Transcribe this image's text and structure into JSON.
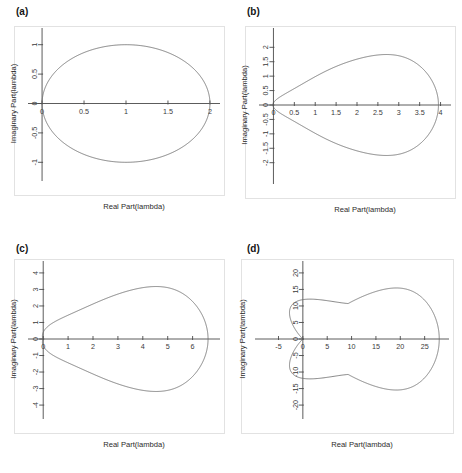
{
  "figure": {
    "background_color": "#ffffff",
    "curve_color": "#6b6b6b",
    "axis_color": "#4a4a4a",
    "frame_color": "#e2e2e2",
    "text_color": "#3a3a3a",
    "panel_count": 4
  },
  "panels": [
    {
      "label": "(a)",
      "xlabel": "Real Part(lambda)",
      "ylabel": "Imaginary Part(lambda)",
      "xticks": [
        "0",
        "0.5",
        "1",
        "1.5",
        "2"
      ],
      "xtick_values": [
        0,
        0.5,
        1,
        1.5,
        2
      ],
      "yticks": [
        "1",
        "0.5",
        "0",
        "-0.5",
        "-1"
      ],
      "ytick_values": [
        1,
        0.5,
        0,
        -0.5,
        -1
      ],
      "xlim": [
        -0.12,
        2.12
      ],
      "ylim": [
        -1.25,
        1.25
      ]
    },
    {
      "label": "(b)",
      "xlabel": "Real Part(lambda)",
      "ylabel": "Imaginary Part(lambda)",
      "xticks": [
        "0",
        "0.5",
        "1",
        "1.5",
        "2",
        "2.5",
        "3",
        "3.5",
        "4"
      ],
      "xtick_values": [
        0,
        0.5,
        1,
        1.5,
        2,
        2.5,
        3,
        3.5,
        4
      ],
      "yticks": [
        "2",
        "1.5",
        "1",
        "0.5",
        "0",
        "-0.5",
        "-1",
        "-1.5",
        "-2"
      ],
      "ytick_values": [
        2,
        1.5,
        1,
        0.5,
        0,
        -0.5,
        -1,
        -1.5,
        -2
      ],
      "xlim": [
        -0.25,
        4.25
      ],
      "ylim": [
        -2.6,
        2.6
      ]
    },
    {
      "label": "(c)",
      "xlabel": "Real Part(lambda)",
      "ylabel": "Imaginary Part(lambda)",
      "xticks": [
        "0",
        "1",
        "2",
        "3",
        "4",
        "5",
        "6"
      ],
      "xtick_values": [
        0,
        1,
        2,
        3,
        4,
        5,
        6
      ],
      "yticks": [
        "4",
        "3",
        "2",
        "1",
        "0",
        "-1",
        "-2",
        "-3",
        "-4"
      ],
      "ytick_values": [
        4,
        3,
        2,
        1,
        0,
        -1,
        -2,
        -3,
        -4
      ],
      "xlim": [
        -0.45,
        7.1
      ],
      "ylim": [
        -4.6,
        4.6
      ]
    },
    {
      "label": "(d)",
      "xlabel": "Real Part(lambda)",
      "ylabel": "Imaginary Part(lambda)",
      "xticks": [
        "-5",
        "0",
        "5",
        "10",
        "15",
        "20",
        "25"
      ],
      "xtick_values": [
        -5,
        0,
        5,
        10,
        15,
        20,
        25
      ],
      "yticks": [
        "20",
        "15",
        "10",
        "5",
        "0",
        "-5",
        "-10",
        "-15",
        "-20"
      ],
      "ytick_values": [
        20,
        15,
        10,
        5,
        0,
        -5,
        -10,
        -15,
        -20
      ],
      "xlim": [
        -9,
        30
      ],
      "ylim": [
        -23,
        23
      ]
    }
  ],
  "chart_data": [
    {
      "type": "line",
      "panel": "(a)",
      "title": "",
      "xlabel": "Real Part(lambda)",
      "ylabel": "Imaginary Part(lambda)",
      "xlim": [
        -0.12,
        2.12
      ],
      "ylim": [
        -1.25,
        1.25
      ],
      "grid": false,
      "legend": "none",
      "description": "Stability region boundary: circle of radius 1 centred at (1,0); locus of 1 - exp(-i*theta).",
      "series": [
        {
          "name": "boundary",
          "closed": true,
          "x": [
            0.0,
            0.0038,
            0.0152,
            0.0341,
            0.0603,
            0.0937,
            0.134,
            0.1808,
            0.2339,
            0.2929,
            0.3572,
            0.4264,
            0.5,
            0.5774,
            0.658,
            0.7412,
            0.8264,
            0.9131,
            1.0,
            1.0869,
            1.1736,
            1.2588,
            1.342,
            1.4226,
            1.5,
            1.5736,
            1.6428,
            1.7071,
            1.7661,
            1.8192,
            1.866,
            1.9063,
            1.9397,
            1.9659,
            1.9848,
            1.9962,
            2.0,
            1.9962,
            1.9848,
            1.9659,
            1.9397,
            1.9063,
            1.866,
            1.8192,
            1.7661,
            1.7071,
            1.6428,
            1.5736,
            1.5,
            1.4226,
            1.342,
            1.2588,
            1.1736,
            1.0869,
            1.0,
            0.9131,
            0.8264,
            0.7412,
            0.658,
            0.5774,
            0.5,
            0.4264,
            0.3572,
            0.2929,
            0.2339,
            0.1808,
            0.134,
            0.0937,
            0.0603,
            0.0341,
            0.0152,
            0.0038,
            0.0
          ],
          "y": [
            0.0,
            0.0872,
            0.1736,
            0.2588,
            0.342,
            0.4226,
            0.5,
            0.5736,
            0.6428,
            0.7071,
            0.766,
            0.8192,
            0.866,
            0.9063,
            0.9397,
            0.9659,
            0.9848,
            0.9962,
            1.0,
            0.9962,
            0.9848,
            0.9659,
            0.9397,
            0.9063,
            0.866,
            0.8192,
            0.766,
            0.7071,
            0.6428,
            0.5736,
            0.5,
            0.4226,
            0.342,
            0.2588,
            0.1736,
            0.0872,
            0.0,
            -0.0872,
            -0.1736,
            -0.2588,
            -0.342,
            -0.4226,
            -0.5,
            -0.5736,
            -0.6428,
            -0.7071,
            -0.766,
            -0.8192,
            -0.866,
            -0.9063,
            -0.9397,
            -0.9659,
            -0.9848,
            -0.9962,
            -1.0,
            -0.9962,
            -0.9848,
            -0.9659,
            -0.9397,
            -0.9063,
            -0.866,
            -0.8192,
            -0.766,
            -0.7071,
            -0.6428,
            -0.5736,
            -0.5,
            -0.4226,
            -0.342,
            -0.2588,
            -0.1736,
            -0.0872,
            0.0
          ]
        }
      ]
    },
    {
      "type": "line",
      "panel": "(b)",
      "title": "",
      "xlabel": "Real Part(lambda)",
      "ylabel": "Imaginary Part(lambda)",
      "xlim": [
        -0.25,
        4.25
      ],
      "ylim": [
        -2.6,
        2.6
      ],
      "grid": false,
      "legend": "none",
      "description": "Stability region boundary, crosses real axis near 0 and 3.95; max |Im| about 2.15 near Re = 1.9; slight inward pinch near the origin.",
      "series": [
        {
          "name": "boundary",
          "closed": true,
          "max_real": 3.95,
          "max_imag": 2.15,
          "imag_at_origin": 0.52
        }
      ]
    },
    {
      "type": "line",
      "panel": "(c)",
      "title": "",
      "xlabel": "Real Part(lambda)",
      "ylabel": "Imaginary Part(lambda)",
      "xlim": [
        -0.45,
        7.1
      ],
      "ylim": [
        -4.6,
        4.6
      ],
      "grid": false,
      "legend": "none",
      "description": "Stability region boundary, crosses real axis near 0 and 6.6; max |Im| about 3.9 near Re = 3.0; inward pinch near origin reaching |Im| about 2.05.",
      "series": [
        {
          "name": "boundary",
          "closed": true,
          "max_real": 6.6,
          "max_imag": 3.9,
          "imag_at_origin": 2.05
        }
      ]
    },
    {
      "type": "line",
      "panel": "(d)",
      "title": "",
      "xlabel": "Real Part(lambda)",
      "ylabel": "Imaginary Part(lambda)",
      "xlim": [
        -9,
        30
      ],
      "ylim": [
        -23,
        23
      ],
      "grid": false,
      "legend": "none",
      "description": "Cardioid-like stability region boundary with a cusp at the origin; crosses real axis near 0 and 28; main lobe max |Im| about 19 near Re = 9; small left lobes extend to Re about -7 with |Im| up to about 17.",
      "series": [
        {
          "name": "boundary",
          "closed": true,
          "max_real": 28,
          "max_imag": 19.3,
          "left_extent": -7.2
        }
      ]
    }
  ]
}
